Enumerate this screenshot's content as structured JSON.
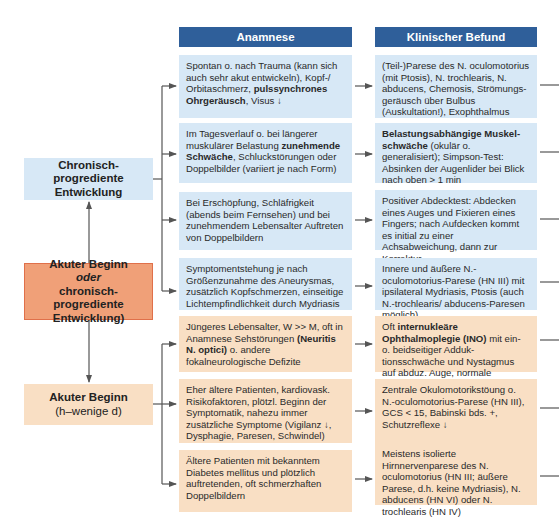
{
  "columns": {
    "anamnese": "Anamnese",
    "befund": "Klinischer Befund"
  },
  "left_boxes": {
    "chronic": {
      "line1": "Chronisch-progrediente",
      "line2": "Entwicklung",
      "color": "#d7e8f6"
    },
    "mixed": {
      "line1": "Akuter Beginn",
      "line2": "oder",
      "line3": "chronisch-progrediente",
      "line4": "Entwicklung)",
      "color": "#f0a078"
    },
    "acute": {
      "line1": "Akuter Beginn",
      "line2": "(h–wenige d)",
      "color": "#f9dfc4"
    }
  },
  "rows": [
    {
      "group": "chronic",
      "anamnese": {
        "pre": "Spontan o. nach Trauma (kann sich auch sehr akut entwickeln), Kopf-/ Orbitaschmerz, ",
        "bold": "pulssynchrones Ohrgeräusch",
        "post": ", Visus ↓"
      },
      "befund": {
        "pre": "(Teil-)Parese des N. oculomotorius (mit Ptosis), N. trochlearis, N. abducens, Chemosis, Strömungs­geräusch über Bulbus (Auskultation!), Exophthalmus",
        "bold": "",
        "post": ""
      }
    },
    {
      "group": "chronic",
      "anamnese": {
        "pre": "Im Tagesverlauf o. bei längerer muskulärer Belastung ",
        "bold": "zunehmende Schwäche",
        "post": ", Schluckstörungen oder Doppelbilder (variiert je nach Form)"
      },
      "befund": {
        "pre": "",
        "bold": "Belastungsabhängige Muskel­schwäche",
        "post": " (okulär o. generalisiert); Simpson-Test: Absinken der Augen­lider bei Blick nach oben > 1 min"
      }
    },
    {
      "group": "chronic",
      "anamnese": {
        "pre": "Bei Erschöpfung, Schläfrigkeit (abends beim Fernsehen) und bei zunehmendem Lebensalter Auftreten von Doppelbildern",
        "bold": "",
        "post": ""
      },
      "befund": {
        "pre": "Positiver Abdecktest: Abdecken eines Auges und Fixieren eines Fingers; nach Aufdecken kommt es initial zu einer Achsabweichung, dann zur Korrektur",
        "bold": "",
        "post": ""
      }
    },
    {
      "group": "mixed",
      "anamnese": {
        "pre": "Symptomentstehung je nach Größenzunahme des Aneurysmas, zusätzlich Kopfschmerzen, einseitige Lichtempfindlichkeit durch Mydriasis",
        "bold": "",
        "post": ""
      },
      "befund": {
        "pre": "Innere und äußere N.-oculomotorius-Parese (HN III) mit ipsilateral Mydriasis, Ptosis (auch N.-trochlearis/ abducens-Paresen möglich)",
        "bold": "",
        "post": ""
      }
    },
    {
      "group": "acute",
      "anamnese": {
        "pre": "Jüngeres Lebensalter, W >> M, oft in Anamnese Sehstörungen ",
        "bold": "(Neuritis N. optici)",
        "post": " o. andere fokalneurologische Defizite"
      },
      "befund": {
        "pre": "Oft ",
        "bold": "internukleäre Ophthalmoplegie (INO)",
        "post": " mit ein- o. beidseitiger Adduk­tionsschwäche und Nystagmus auf abduz. Auge, normale Konvergenz"
      }
    },
    {
      "group": "acute",
      "anamnese": {
        "pre": "Eher ältere Patienten, kardiovask. Risikofaktoren, plötzl. Beginn der Symptomatik, nahezu immer zusätzliche Symptome (Vigilanz ↓, Dysphagie, Paresen, Schwindel)",
        "bold": "",
        "post": ""
      },
      "befund": {
        "pre": "Zentrale Okulomotorikstöung o. N.-oculomotorius-Parese (HN III), GCS < 15, Babinski bds. +, Schutzreflexe ↓",
        "bold": "",
        "post": ""
      }
    },
    {
      "group": "acute",
      "anamnese": {
        "pre": "Ältere Patienten mit bekanntem Diabetes mellitus und plötzlich auftretenden, oft schmerzhaften Doppelbildern",
        "bold": "",
        "post": ""
      },
      "befund": {
        "pre": "Meistens isolierte Hirnnervenparese des N. oculomotorius (HN III; äußere Parese, d.h. keine Mydriasis), N. abducens (HN VI) oder N. trochlearis (HN IV)",
        "bold": "",
        "post": ""
      }
    }
  ],
  "colors": {
    "header": "#2f5f9a",
    "blue_box": "#d7e8f6",
    "orange_box": "#f9dfc4",
    "mid_box": "#f0a078",
    "connector": "#555555"
  }
}
